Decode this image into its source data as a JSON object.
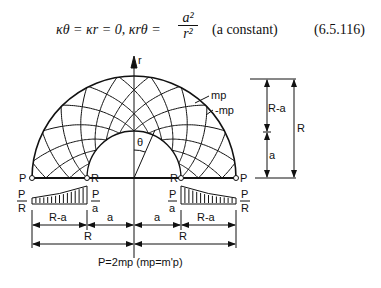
{
  "equation": {
    "lhs": "κθ = κr = 0,   κrθ =",
    "frac_num": "a²",
    "frac_den": "r²",
    "note": "(a constant)",
    "number": "(6.5.116)"
  },
  "diagram": {
    "axis_label": "r",
    "angle_label": "θ",
    "moment_labels": [
      "mp",
      "-mp"
    ],
    "support_outer": "P",
    "support_inner": "R",
    "load_outer": {
      "num": "P",
      "den": "R"
    },
    "load_inner": {
      "num": "P",
      "den": "a"
    },
    "dim_labels": {
      "r_minus_a": "R-a",
      "a": "a",
      "r": "R"
    },
    "caption": "P=2mp  (mp=m'p)"
  }
}
